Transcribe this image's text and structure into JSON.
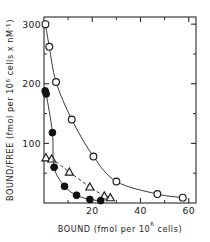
{
  "figure": {
    "name": "scatchard-plot",
    "background": "#ffffff",
    "ink_color": "#1a1a1a"
  },
  "chart_data": {
    "type": "scatter",
    "title": "",
    "xlabel": "BOUND (fmol per 10⁶ cells)",
    "ylabel": "BOUND/FREE (fmol per 10⁶ cells x nM⁻¹)",
    "xlabel_parts": {
      "pre": "BOUND (fmol per 10",
      "sup": "6",
      "post": " cells)"
    },
    "ylabel_parts": {
      "pre": "BOUND/FREE (fmol per 10",
      "sup": "6",
      "mid": " cells x nM",
      "sup2": "-1",
      "post": ")"
    },
    "xlim": [
      0,
      63
    ],
    "ylim": [
      0,
      312
    ],
    "xticks": [
      20,
      40,
      60
    ],
    "xticklabels": [
      "20",
      "40",
      "60"
    ],
    "xminorticks": [
      10,
      30,
      50
    ],
    "yticks": [
      100,
      200,
      300
    ],
    "yticklabels": [
      "100",
      "200",
      "300"
    ],
    "yminorticks": [
      50,
      150,
      250
    ],
    "grid": false,
    "legend": "none",
    "frame": "box",
    "tick_direction": "in",
    "series": [
      {
        "name": "open-circles",
        "marker": "circle-open",
        "linestyle": "solid",
        "x": [
          0.6,
          2.2,
          5.0,
          11.5,
          20.5,
          30.0,
          47.0,
          57.5
        ],
        "y": [
          300,
          262,
          203,
          140,
          78,
          36,
          15,
          9
        ]
      },
      {
        "name": "open-triangles",
        "marker": "triangle-open",
        "linestyle": "dashed",
        "x": [
          0.8,
          3.2,
          10.5,
          19.0,
          25.0,
          27.5
        ],
        "y": [
          76,
          74,
          52,
          27,
          12,
          9
        ]
      },
      {
        "name": "filled-circles",
        "marker": "circle-filled",
        "linestyle": "solid",
        "x": [
          0.5,
          0.9,
          3.5,
          4.2,
          8.5,
          13.5,
          19.0,
          23.5
        ],
        "y": [
          188,
          183,
          118,
          60,
          28,
          13,
          6,
          4
        ]
      }
    ]
  }
}
